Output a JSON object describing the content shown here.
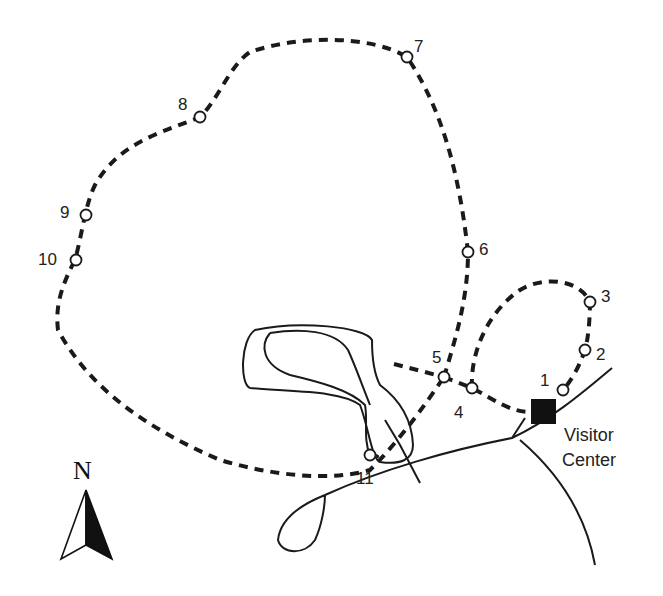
{
  "map": {
    "title": "",
    "visitor_center": {
      "line1": "Visitor",
      "line2": "Center"
    },
    "north_label": "N",
    "stops": [
      {
        "id": "1",
        "label": "1"
      },
      {
        "id": "2",
        "label": "2"
      },
      {
        "id": "3",
        "label": "3"
      },
      {
        "id": "4",
        "label": "4"
      },
      {
        "id": "5",
        "label": "5"
      },
      {
        "id": "6",
        "label": "6"
      },
      {
        "id": "7",
        "label": "7"
      },
      {
        "id": "8",
        "label": "8"
      },
      {
        "id": "9",
        "label": "9"
      },
      {
        "id": "10",
        "label": "10"
      },
      {
        "id": "11",
        "label": "11"
      }
    ],
    "colors": {
      "ink": "#1a1a1a",
      "background": "#ffffff"
    }
  }
}
